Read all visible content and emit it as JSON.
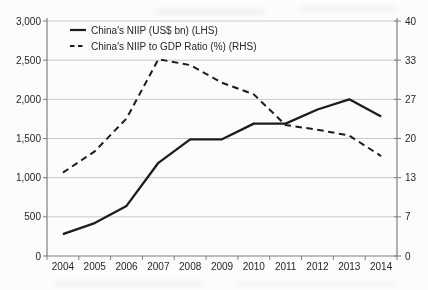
{
  "chart": {
    "background": "#fcfcfb",
    "line_color": "#1c1c1c",
    "grid_color": "#cacac8",
    "axis_color": "#7f7f7f",
    "text_color": "#262626"
  },
  "chart_data": {
    "type": "line",
    "title": "",
    "categories": [
      "2004",
      "2005",
      "2006",
      "2007",
      "2008",
      "2009",
      "2010",
      "2011",
      "2012",
      "2013",
      "2014"
    ],
    "series": [
      {
        "name": "China's NIIP (US$ bn) (LHS)",
        "axis": "left",
        "line_style": "solid",
        "values": [
          280,
          420,
          640,
          1190,
          1490,
          1490,
          1690,
          1690,
          1870,
          2000,
          1780
        ]
      },
      {
        "name": "China's NIIP to GDP Ratio (%) (RHS)",
        "axis": "right",
        "line_style": "dashed",
        "values": [
          14.2,
          17.8,
          23.4,
          33.5,
          32.5,
          29.5,
          27.5,
          22.3,
          21.5,
          20.5,
          17.0
        ]
      }
    ],
    "left_axis": {
      "range": [
        0,
        3000
      ],
      "tick_step": 500,
      "tick_labels": [
        "0",
        "500",
        "1,000",
        "1,500",
        "2,000",
        "2,500",
        "3,000"
      ]
    },
    "right_axis": {
      "range": [
        0,
        40
      ],
      "tick_labels": [
        "0",
        "7",
        "13",
        "20",
        "27",
        "33",
        "40"
      ]
    },
    "xlabel": "",
    "ylabel": "",
    "grid": "horizontal-only",
    "legend_position": "top-left-inside"
  }
}
